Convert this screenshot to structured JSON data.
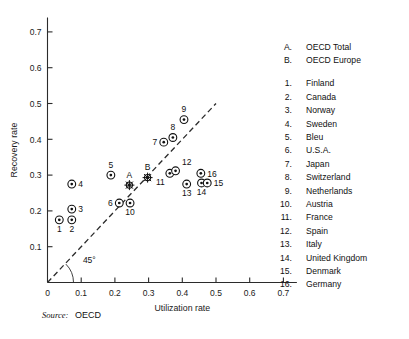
{
  "chart_data": {
    "type": "scatter",
    "title": "",
    "xlabel": "Utilization rate",
    "ylabel": "Recovery rate",
    "xlim": [
      0,
      0.74
    ],
    "ylim": [
      0,
      0.74
    ],
    "xticks": [
      "0",
      "0.1",
      "0.2",
      "0.3",
      "0.4",
      "0.5",
      "0.6",
      "0.7"
    ],
    "xtick_values": [
      0,
      0.1,
      0.2,
      0.3,
      0.4,
      0.5,
      0.6,
      0.7
    ],
    "yticks": [
      "0.1",
      "0.2",
      "0.3",
      "0.4",
      "0.5",
      "0.6",
      "0.7"
    ],
    "ytick_values": [
      0.1,
      0.2,
      0.3,
      0.4,
      0.5,
      0.6,
      0.7
    ],
    "grid": false,
    "legend_position": "right",
    "annotations": [
      {
        "text": "45°",
        "x": 0.105,
        "y": 0.055
      }
    ],
    "reference_line": {
      "label": "45° diagonal",
      "style": "dashed",
      "from": [
        0.0,
        0.0
      ],
      "to": [
        0.5,
        0.5
      ]
    },
    "points": [
      {
        "label": "1",
        "name": "Finland",
        "x": 0.035,
        "y": 0.175,
        "marker": "circle-dot",
        "label_pos": "below"
      },
      {
        "label": "2",
        "name": "Canada",
        "x": 0.072,
        "y": 0.175,
        "marker": "circle-dot",
        "label_pos": "below"
      },
      {
        "label": "3",
        "name": "Norway",
        "x": 0.072,
        "y": 0.205,
        "marker": "circle-dot",
        "label_pos": "right"
      },
      {
        "label": "4",
        "name": "Sweden",
        "x": 0.072,
        "y": 0.275,
        "marker": "circle-dot",
        "label_pos": "right"
      },
      {
        "label": "5",
        "name": "Bleu",
        "x": 0.188,
        "y": 0.3,
        "marker": "circle-dot",
        "label_pos": "above"
      },
      {
        "label": "6",
        "name": "U.S.A.",
        "x": 0.213,
        "y": 0.222,
        "marker": "circle-dot",
        "label_pos": "left"
      },
      {
        "label": "7",
        "name": "Japan",
        "x": 0.345,
        "y": 0.392,
        "marker": "circle-dot",
        "label_pos": "left"
      },
      {
        "label": "8",
        "name": "Switzerland",
        "x": 0.372,
        "y": 0.405,
        "marker": "circle-dot",
        "label_pos": "above"
      },
      {
        "label": "9",
        "name": "Netherlands",
        "x": 0.405,
        "y": 0.455,
        "marker": "circle-dot",
        "label_pos": "above"
      },
      {
        "label": "10",
        "name": "Austria",
        "x": 0.245,
        "y": 0.222,
        "marker": "circle-dot",
        "label_pos": "below"
      },
      {
        "label": "11",
        "name": "France",
        "x": 0.363,
        "y": 0.305,
        "marker": "circle-dot",
        "label_pos": "below-left"
      },
      {
        "label": "12",
        "name": "Spain",
        "x": 0.38,
        "y": 0.312,
        "marker": "circle-dot",
        "label_pos": "above-right"
      },
      {
        "label": "13",
        "name": "Italy",
        "x": 0.413,
        "y": 0.275,
        "marker": "circle-dot",
        "label_pos": "below"
      },
      {
        "label": "14",
        "name": "United Kingdom",
        "x": 0.457,
        "y": 0.278,
        "marker": "circle-dot",
        "label_pos": "below"
      },
      {
        "label": "15",
        "name": "Denmark",
        "x": 0.474,
        "y": 0.278,
        "marker": "circle-dot",
        "label_pos": "right"
      },
      {
        "label": "16",
        "name": "Germany",
        "x": 0.455,
        "y": 0.305,
        "marker": "circle-dot",
        "label_pos": "right"
      },
      {
        "label": "A",
        "name": "OECD Total",
        "x": 0.243,
        "y": 0.272,
        "marker": "star",
        "label_pos": "above"
      },
      {
        "label": "B",
        "name": "OECD Europe",
        "x": 0.297,
        "y": 0.293,
        "marker": "star",
        "label_pos": "above"
      }
    ]
  },
  "legend": {
    "groups": [
      {
        "items": [
          {
            "key": "A.",
            "label": "OECD Total"
          },
          {
            "key": "B.",
            "label": "OECD Europe"
          }
        ]
      },
      {
        "items": [
          {
            "key": "1.",
            "label": "Finland"
          },
          {
            "key": "2.",
            "label": "Canada"
          },
          {
            "key": "3.",
            "label": "Norway"
          },
          {
            "key": "4.",
            "label": "Sweden"
          },
          {
            "key": "5.",
            "label": "Bleu"
          },
          {
            "key": "6.",
            "label": "U.S.A."
          },
          {
            "key": "7.",
            "label": "Japan"
          },
          {
            "key": "8.",
            "label": "Switzerland"
          },
          {
            "key": "9.",
            "label": "Netherlands"
          },
          {
            "key": "10.",
            "label": "Austria"
          },
          {
            "key": "11.",
            "label": "France"
          },
          {
            "key": "12.",
            "label": "Spain"
          },
          {
            "key": "13.",
            "label": "Italy"
          },
          {
            "key": "14.",
            "label": "United Kingdom"
          },
          {
            "key": "15.",
            "label": "Denmark"
          },
          {
            "key": "16.",
            "label": "Germany"
          }
        ]
      }
    ]
  },
  "source": {
    "label": "Source:",
    "value": "OECD"
  }
}
